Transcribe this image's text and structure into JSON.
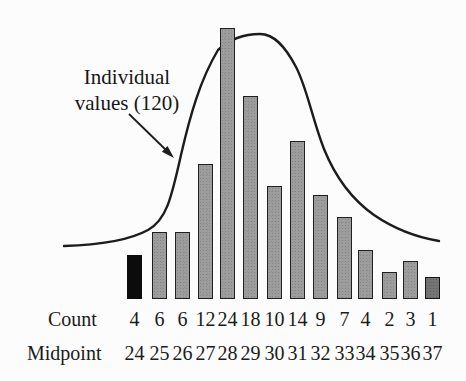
{
  "chart_data": {
    "type": "bar",
    "subtype": "histogram-with-normal-curve-overlay",
    "title": "",
    "annotation": "Individual values (120)",
    "annotation_lines": [
      "Individual",
      "values (120)"
    ],
    "annotation_points_to": "normal-curve",
    "total_individual_values": 120,
    "row_labels": {
      "count": "Count",
      "midpoint": "Midpoint"
    },
    "categories": [
      24,
      25,
      26,
      27,
      28,
      29,
      30,
      31,
      32,
      33,
      34,
      35,
      36,
      37
    ],
    "values": [
      4,
      6,
      6,
      12,
      24,
      18,
      10,
      14,
      9,
      7,
      4,
      2,
      3,
      1
    ],
    "xlabel": "Midpoint",
    "ylabel": "Count",
    "legend": "none",
    "grid": "off",
    "axes_drawn": "none",
    "bar_styles": [
      "black",
      "gray",
      "gray",
      "gray",
      "gray",
      "gray",
      "gray",
      "gray",
      "gray",
      "gray",
      "gray",
      "gray",
      "gray",
      "dark-gray"
    ],
    "overlay_curve": {
      "shape": "bell",
      "peak_between_midpoints": [
        28,
        29
      ]
    },
    "colors": {
      "background": "#fcfcfc",
      "bar_fill": "#9d9d9d",
      "bar_border": "#1f1f1f",
      "first_bar_fill": "#0c0c0c",
      "last_bar_fill": "#747474",
      "curve_stroke": "#1c1c1c",
      "text": "#1b1b1b"
    }
  }
}
